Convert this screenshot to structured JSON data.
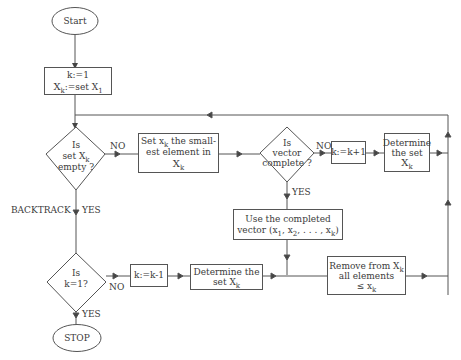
{
  "diagram": {
    "type": "flowchart",
    "nodes": {
      "start": {
        "label": "Start"
      },
      "init": {
        "line1": "k:=1",
        "line2_main": "X",
        "line2_sub": "k",
        "line2_mid": ":=set X",
        "line2_sub2": "1"
      },
      "empty_q": {
        "line1": "Is",
        "line2_main": "set X",
        "line2_sub": "k",
        "line3": "empty ?"
      },
      "set_smallest": {
        "pre": "Set x",
        "sub": "k",
        "post": " the small-",
        "line2": "est element in",
        "line3_main": "X",
        "line3_sub": "k"
      },
      "complete_q": {
        "line1": "Is",
        "line2": "vector",
        "line3": "complete ?"
      },
      "inc_k": {
        "label": "k:=k+1"
      },
      "determine_1": {
        "line1": "Determine",
        "line2": "the set",
        "line3_main": "X",
        "line3_sub": "k"
      },
      "use_vector": {
        "line1": "Use the completed",
        "line2_pre": "vector (x",
        "s1": "1",
        "m1": ", x",
        "s2": "2",
        "m2": ", . . . , x",
        "s3": "k",
        "end": ")"
      },
      "k1_q": {
        "line1": "Is",
        "line2": "k=1?"
      },
      "dec_k": {
        "label": "k:=k-1"
      },
      "determine_2": {
        "line1": "Determine the",
        "line2_main": "set X",
        "line2_sub": "k"
      },
      "remove": {
        "line1_main": "Remove from X",
        "line1_sub": "k",
        "line2": "all elements",
        "line3_main": "≤ x",
        "line3_sub": "k"
      },
      "stop": {
        "label": "STOP"
      }
    },
    "edge_labels": {
      "empty_no": "NO",
      "backtrack": "BACKTRACK",
      "empty_yes": "YES",
      "complete_no": "NO",
      "complete_yes": "YES",
      "k1_no": "NO",
      "k1_yes": "YES"
    },
    "colors": {
      "line": "#555555",
      "text": "#3a3a3a",
      "background": "#ffffff"
    }
  }
}
